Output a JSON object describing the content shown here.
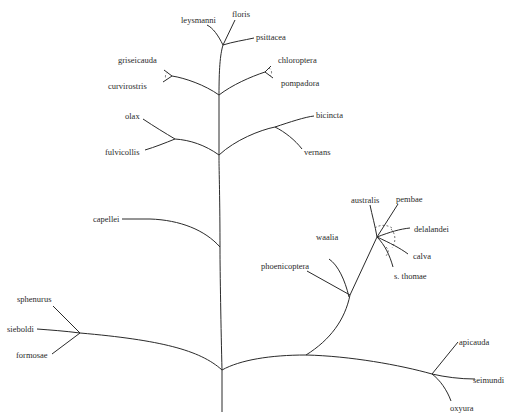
{
  "diagram": {
    "type": "phylogenetic-tree",
    "taxa": {
      "leysmanni": "leysmanni",
      "floris": "floris",
      "psittacea": "psittacea",
      "griseicauda": "griseicauda",
      "curvirostris": "curvirostris",
      "chloroptera": "chloroptera",
      "pompadora": "pompadora",
      "olax": "olax",
      "fulvicollis": "fulvicollis",
      "bicincta": "bicincta",
      "vernans": "vernans",
      "capellei": "capellei",
      "australis": "australis",
      "pembae": "pembae",
      "delalandei": "delalandei",
      "calva": "calva",
      "s_thomae": "s. thomae",
      "waalia": "waalia",
      "phoenicoptera": "phoenicoptera",
      "sphenurus": "sphenurus",
      "sieboldi": "sieboldi",
      "formosae": "formosae",
      "apicauda": "apicauda",
      "seimundi": "seimundi",
      "oxyura": "oxyura"
    },
    "line_color": "#2a2a2a",
    "background": "#ffffff"
  }
}
